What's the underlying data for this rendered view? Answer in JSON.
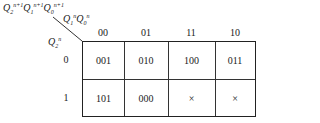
{
  "kmap": {
    "output_label": {
      "q2": "Q",
      "q2_sub": "2",
      "q2_sup": "n+1",
      "q1": "Q",
      "q1_sub": "1",
      "q1_sup": "n+1",
      "q0": "Q",
      "q0_sub": "0",
      "q0_sup": "n+1"
    },
    "col_var_label": {
      "q1": "Q",
      "q1_sub": "1",
      "q1_sup": "n",
      "q0": "Q",
      "q0_sub": "0",
      "q0_sup": "n"
    },
    "row_var_label": {
      "q2": "Q",
      "q2_sub": "2",
      "q2_sup": "n"
    },
    "columns": [
      "00",
      "01",
      "11",
      "10"
    ],
    "rows": [
      "0",
      "1"
    ],
    "cells": [
      [
        "001",
        "010",
        "100",
        "011"
      ],
      [
        "101",
        "000",
        "×",
        "×"
      ]
    ]
  }
}
